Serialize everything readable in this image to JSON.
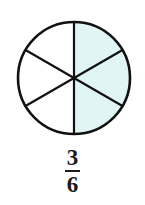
{
  "figure": {
    "name": "fraction-circle-three-sixths",
    "type": "fraction-model",
    "background_color": "#ffffff"
  },
  "circle": {
    "center_x": 74,
    "center_y": 78,
    "radius": 56,
    "stroke_color": "#111111",
    "stroke_width": 2.6,
    "fill_color": "#ffffff",
    "total_parts": 6,
    "shaded_parts": 3,
    "shaded_color": "#e1f5f7",
    "unshaded_color": "#ffffff",
    "divider_color": "#111111",
    "divider_width": 2.2,
    "sector_angle_degrees": 60,
    "sectors": [
      {
        "id": "sector-1",
        "start_angle": -90,
        "end_angle": -30,
        "shaded": true,
        "position": "top-right"
      },
      {
        "id": "sector-2",
        "start_angle": -30,
        "end_angle": 30,
        "shaded": true,
        "position": "right"
      },
      {
        "id": "sector-3",
        "start_angle": 30,
        "end_angle": 90,
        "shaded": true,
        "position": "bottom-right"
      },
      {
        "id": "sector-4",
        "start_angle": 90,
        "end_angle": 150,
        "shaded": false,
        "position": "bottom-left"
      },
      {
        "id": "sector-5",
        "start_angle": 150,
        "end_angle": 210,
        "shaded": false,
        "position": "left"
      },
      {
        "id": "sector-6",
        "start_angle": 210,
        "end_angle": 270,
        "shaded": false,
        "position": "top-left"
      }
    ]
  },
  "label": {
    "numerator": "3",
    "denominator": "6",
    "text": "3/6",
    "color": "#1b1b1b"
  }
}
